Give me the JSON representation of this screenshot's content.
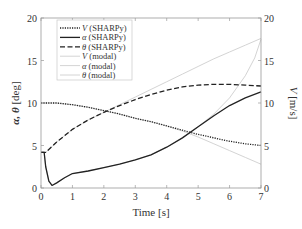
{
  "chart_data": {
    "type": "line",
    "title": "",
    "xlabel": "Time [s]",
    "ylabel_left": "α, θ [deg]",
    "ylabel_right": "V [m/s]",
    "xlim": [
      0,
      7
    ],
    "ylim_left": [
      0,
      20
    ],
    "ylim_right": [
      0,
      20
    ],
    "xticks": [
      0,
      1,
      2,
      3,
      4,
      5,
      6,
      7
    ],
    "yticks_left": [
      0,
      5,
      10,
      15,
      20
    ],
    "yticks_right": [
      0,
      5,
      10,
      15,
      20
    ],
    "grid": false,
    "legend_position": "upper left",
    "series": [
      {
        "name": "V (SHARPy)",
        "axis": "right",
        "style": "dotted",
        "color": "#222222",
        "width": 1.3,
        "x": [
          0,
          0.5,
          1,
          1.5,
          2,
          2.5,
          3,
          3.5,
          4,
          4.5,
          5,
          5.5,
          6,
          6.5,
          7
        ],
        "y": [
          10.0,
          10.0,
          9.8,
          9.5,
          9.1,
          8.7,
          8.2,
          7.8,
          7.3,
          6.8,
          6.3,
          5.9,
          5.5,
          5.2,
          5.0
        ]
      },
      {
        "name": "α (SHARPy)",
        "axis": "left",
        "style": "solid",
        "color": "#222222",
        "width": 1.3,
        "x": [
          0,
          0.1,
          0.15,
          0.25,
          0.35,
          0.5,
          0.75,
          1,
          1.5,
          2,
          2.5,
          3,
          3.5,
          4,
          4.5,
          5,
          5.5,
          6,
          6.5,
          7
        ],
        "y": [
          4.2,
          4.2,
          2.5,
          0.8,
          0.3,
          0.6,
          1.2,
          1.7,
          2.0,
          2.4,
          2.8,
          3.3,
          3.9,
          4.8,
          5.9,
          7.2,
          8.5,
          9.7,
          10.6,
          11.3
        ]
      },
      {
        "name": "θ (SHARPy)",
        "axis": "left",
        "style": "dashed",
        "color": "#222222",
        "width": 1.3,
        "x": [
          0,
          0.15,
          0.5,
          1,
          1.5,
          2,
          2.5,
          3,
          3.5,
          4,
          4.5,
          5,
          5.5,
          6,
          6.5,
          7
        ],
        "y": [
          4.2,
          4.2,
          5.4,
          6.9,
          8.0,
          8.9,
          9.7,
          10.4,
          11.0,
          11.5,
          11.9,
          12.1,
          12.2,
          12.2,
          12.1,
          12.0
        ]
      },
      {
        "name": "V (modal)",
        "axis": "right",
        "style": "solid",
        "color": "#d4d4d4",
        "width": 1.0,
        "x": [
          0,
          0.5,
          1,
          1.5,
          2,
          2.5,
          3,
          3.5,
          4,
          4.5,
          5,
          5.5,
          6,
          6.5,
          7
        ],
        "y": [
          10.0,
          10.0,
          9.8,
          9.5,
          9.1,
          8.7,
          8.2,
          7.8,
          7.3,
          6.7,
          6.0,
          5.2,
          4.4,
          3.6,
          2.8
        ]
      },
      {
        "name": "α (modal)",
        "axis": "left",
        "style": "solid",
        "color": "#d4d4d4",
        "width": 1.0,
        "x": [
          0,
          0.1,
          0.15,
          0.25,
          0.35,
          0.5,
          0.75,
          1,
          1.5,
          2,
          2.5,
          3,
          3.5,
          4,
          4.5,
          5,
          5.5,
          6,
          6.5,
          6.8,
          7
        ],
        "y": [
          4.2,
          4.2,
          2.5,
          0.8,
          0.3,
          0.6,
          1.2,
          1.7,
          2.0,
          2.4,
          2.8,
          3.3,
          3.9,
          4.8,
          5.9,
          7.2,
          8.7,
          10.6,
          13.2,
          15.3,
          17.5
        ]
      },
      {
        "name": "θ (modal)",
        "axis": "left",
        "style": "solid",
        "color": "#d4d4d4",
        "width": 1.0,
        "x": [
          0,
          0.15,
          0.5,
          1,
          1.5,
          2,
          2.5,
          3,
          3.5,
          4,
          4.5,
          5,
          5.5,
          6,
          6.5,
          7
        ],
        "y": [
          4.2,
          4.2,
          5.4,
          6.9,
          8.0,
          8.9,
          9.8,
          10.7,
          11.6,
          12.5,
          13.4,
          14.3,
          15.2,
          16.0,
          16.8,
          17.6
        ]
      }
    ]
  },
  "legend": {
    "items": [
      {
        "symbol": "V",
        "suffix": " (SHARPy)"
      },
      {
        "symbol": "α",
        "suffix": " (SHARPy)"
      },
      {
        "symbol": "θ",
        "suffix": " (SHARPy)"
      },
      {
        "symbol": "V",
        "suffix": " (modal)"
      },
      {
        "symbol": "α",
        "suffix": " (modal)"
      },
      {
        "symbol": "θ",
        "suffix": " (modal)"
      }
    ]
  },
  "labels": {
    "xlabel": "Time [s]",
    "ylabel_left_symbols": "α, θ",
    "ylabel_left_unit": " [deg]",
    "ylabel_right_symbol": "V",
    "ylabel_right_unit": " [m/s]"
  },
  "colors": {
    "axis": "#9a9a9a",
    "text": "#333333",
    "sharpy": "#222222",
    "modal": "#d4d4d4"
  }
}
